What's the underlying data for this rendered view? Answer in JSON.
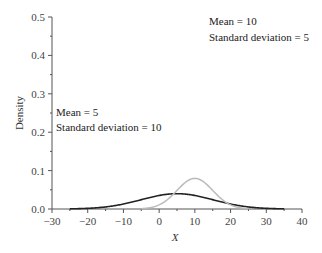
{
  "chart_data": {
    "type": "line",
    "title": "",
    "xlabel": "X",
    "ylabel": "Density",
    "xlim": [
      -30,
      40
    ],
    "ylim": [
      0,
      0.5
    ],
    "xticks": [
      -30,
      -20,
      -10,
      0,
      10,
      20,
      30,
      40
    ],
    "xtick_labels": [
      "−30",
      "−20",
      "−10",
      "0",
      "10",
      "20",
      "30",
      "40"
    ],
    "yticks": [
      0.0,
      0.1,
      0.2,
      0.3,
      0.4,
      0.5
    ],
    "ytick_labels": [
      "0.0",
      "0.1",
      "0.2",
      "0.3",
      "0.4",
      "0.5"
    ],
    "grid": false,
    "legend": null,
    "series": [
      {
        "name": "Mean = 5, Standard deviation = 10",
        "mean": 5,
        "sd": 10,
        "x_range": [
          -25,
          35
        ],
        "color": "#222222",
        "peak": 0.25
      },
      {
        "name": "Mean = 10, Standard deviation = 5",
        "mean": 10,
        "sd": 5,
        "x_range": [
          -5,
          25
        ],
        "color": "#bbbbbb",
        "peak": 0.5
      }
    ],
    "annotations": [
      {
        "line1": "Mean = 10",
        "line2": "Standard deviation = 5"
      },
      {
        "line1": "Mean = 5",
        "line2": "Standard deviation = 10"
      }
    ]
  }
}
